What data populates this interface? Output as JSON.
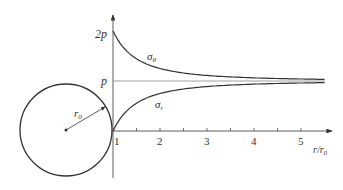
{
  "figure": {
    "y_labels": {
      "two_p": "2p",
      "p": "p"
    },
    "x_ticks": [
      "1",
      "2",
      "3",
      "4",
      "5"
    ],
    "x_axis_label": {
      "main": "r/r",
      "sub": "0"
    },
    "curve_labels": {
      "sigma_theta": {
        "main": "σ",
        "sub": "θ"
      },
      "sigma_r": {
        "main": "σ",
        "sub": "r"
      }
    },
    "radius_label": {
      "main": "r",
      "sub": "0"
    },
    "colors": {
      "line": "#333333",
      "p_line": "#888888"
    }
  },
  "chart_data": {
    "type": "line",
    "title": "",
    "xlabel": "r/r0",
    "ylabel": "",
    "x": [
      1,
      1.5,
      2,
      2.5,
      3,
      3.5,
      4,
      4.5,
      5,
      5.2
    ],
    "series": [
      {
        "name": "σθ",
        "values": [
          2.0,
          1.444,
          1.25,
          1.16,
          1.111,
          1.082,
          1.0625,
          1.049,
          1.04,
          1.037
        ]
      },
      {
        "name": "σr",
        "values": [
          0.0,
          0.556,
          0.75,
          0.84,
          0.889,
          0.918,
          0.9375,
          0.951,
          0.96,
          0.963
        ]
      }
    ],
    "y_ticks": [
      "p",
      "2p"
    ],
    "reference_line": "p",
    "xlim": [
      1,
      5.2
    ],
    "grid": false
  }
}
